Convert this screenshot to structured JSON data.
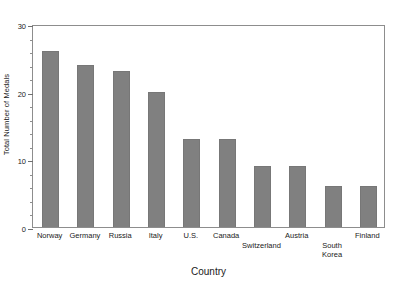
{
  "chart_data": {
    "type": "bar",
    "title": "",
    "xlabel": "Country",
    "ylabel": "Total Number of Medals",
    "categories": [
      "Norway",
      "Germany",
      "Russia",
      "Italy",
      "U.S.",
      "Canada",
      "Switzerland",
      "Austria",
      "South Korea",
      "Finland"
    ],
    "category_label_rows": [
      0,
      0,
      0,
      0,
      0,
      0,
      1,
      0,
      1,
      0
    ],
    "category_display": [
      "Norway",
      "Germany",
      "Russia",
      "Italy",
      "U.S.",
      "Canada",
      "Switzerland",
      "Austria",
      "South\nKorea",
      "Finland"
    ],
    "values": [
      26,
      24,
      23,
      20,
      13,
      13,
      9,
      9,
      6,
      6
    ],
    "ylim": [
      0,
      30
    ],
    "ytick_major": [
      0,
      10,
      20,
      30
    ],
    "ytick_minor": [
      2,
      4,
      6,
      8,
      12,
      14,
      16,
      18,
      22,
      24,
      26,
      28
    ],
    "grid": false,
    "legend": "none",
    "bar_color": "#808080",
    "frame_color": "#8d8d8d"
  },
  "axes": {
    "y_title": "Total Number of Medals",
    "x_title": "Country"
  }
}
